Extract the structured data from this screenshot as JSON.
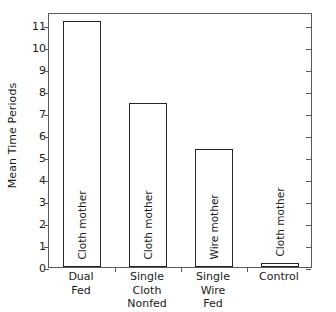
{
  "chart_data": {
    "type": "bar",
    "title": "",
    "subtitle": "",
    "xlabel": "",
    "ylabel": "Mean Time Periods",
    "ylim": [
      0,
      11.6
    ],
    "yticks": [
      0,
      1,
      2,
      3,
      4,
      5,
      6,
      7,
      8,
      9,
      10,
      11
    ],
    "ytick_labels": [
      "0",
      "1",
      "2",
      "3",
      "4",
      "5",
      "6",
      "7",
      "8",
      "9",
      "10",
      "11"
    ],
    "grid": false,
    "legend": "none",
    "frame": "full-box",
    "tick_direction": "outward-left-bottom, inward-right",
    "bar_style": "open outline, white fill, black edge",
    "categories": [
      "Dual\nFed",
      "Single\nCloth\nNonfed",
      "Single\nWire\nFed",
      "Control"
    ],
    "category_lines": [
      [
        "Dual",
        "Fed"
      ],
      [
        "Single",
        "Cloth",
        "Nonfed"
      ],
      [
        "Single",
        "Wire",
        "Fed"
      ],
      [
        "Control"
      ]
    ],
    "values": [
      11.2,
      7.45,
      5.35,
      0.2
    ],
    "bar_annotations": [
      "Cloth mother",
      "Cloth mother",
      "Wire mother",
      "Cloth mother"
    ],
    "annotation_rotation": "90deg (bottom-to-top)",
    "colors": {
      "bar_edge": "#262626",
      "bar_fill": "#ffffff",
      "axis": "#5a5a5a",
      "text": "#1a1a1a",
      "background": "#ffffff"
    }
  }
}
